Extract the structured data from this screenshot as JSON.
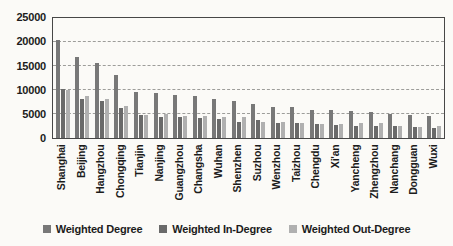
{
  "chart_data": {
    "type": "bar",
    "title": "",
    "xlabel": "",
    "ylabel": "",
    "ylim": [
      0,
      25000
    ],
    "ytick_interval": 5000,
    "yticks": [
      "0",
      "5000",
      "10000",
      "15000",
      "20000",
      "25000"
    ],
    "grid": "horizontal-dashed",
    "legend_position": "bottom",
    "categories": [
      "Shanghai",
      "Beijing",
      "Hangzhou",
      "Chongqing",
      "Tianjin",
      "Nanjing",
      "Guangzhou",
      "Changsha",
      "Wuhan",
      "Shenzhen",
      "Suzhou",
      "Wenzhou",
      "Taizhou",
      "Chengdu",
      "Xi'an",
      "Yancheng",
      "Zhengzhou",
      "Nanchang",
      "Dongguan",
      "Wuxi"
    ],
    "series": [
      {
        "name": "Weighted Degree",
        "color": "#787878",
        "values": [
          20400,
          16900,
          15700,
          13100,
          9600,
          9300,
          8900,
          8700,
          8200,
          7700,
          7000,
          6500,
          6400,
          5900,
          5800,
          5700,
          5500,
          5100,
          4800,
          4500
        ]
      },
      {
        "name": "Weighted In-Degree",
        "color": "#6a6a6a",
        "values": [
          10200,
          8200,
          7700,
          6300,
          4700,
          4400,
          4300,
          4200,
          3900,
          3300,
          3700,
          3200,
          3200,
          2900,
          2800,
          2600,
          2400,
          2500,
          2300,
          2000
        ]
      },
      {
        "name": "Weighted Out-Degree",
        "color": "#b0b0b0",
        "values": [
          10000,
          8700,
          8100,
          6700,
          4800,
          4900,
          4500,
          4500,
          4300,
          4400,
          3300,
          3300,
          3200,
          3000,
          3000,
          3100,
          3100,
          2600,
          2200,
          2500
        ]
      }
    ]
  }
}
